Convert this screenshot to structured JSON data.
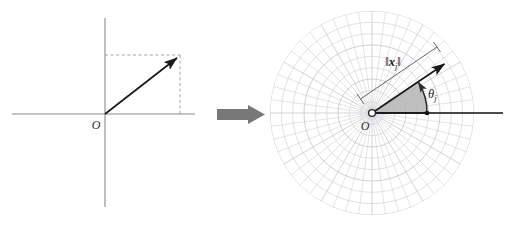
{
  "figure": {
    "background": "#ffffff",
    "width": 511,
    "height": 225,
    "caption": "Cartesian vector transformed to polar representation"
  },
  "left_panel": {
    "name": "cartesian-axes-diagram",
    "origin_label": "O",
    "axis_color": "#8a8a8a",
    "vector_color": "#1a1a1a",
    "dashed_color": "#9a9a9a",
    "origin": {
      "x": 105,
      "y": 114
    },
    "vector_tip": {
      "x": 180,
      "y": 55
    },
    "x_axis": {
      "x1": 12,
      "y1": 114,
      "x2": 195,
      "y2": 114
    },
    "y_axis": {
      "x1": 105,
      "y1": 18,
      "x2": 105,
      "y2": 207
    }
  },
  "transform_arrow": {
    "name": "transform-arrow",
    "color": "#787878",
    "x": 217,
    "y": 105,
    "width": 48,
    "height": 19
  },
  "right_panel": {
    "name": "polar-grid-diagram",
    "origin_label": "O",
    "norm_label": "‖xⱼ‖",
    "norm_label_plain": "||x_j||",
    "angle_label": "θⱼ",
    "angle_label_plain": "theta_j",
    "grid_color": "#c9c9cf",
    "sector_fill": "#b5b5b5",
    "sector_stroke": "#2a2a2a",
    "vector_color": "#1a1a1a",
    "ray_color": "#111111",
    "center": {
      "x": 372,
      "y": 113
    },
    "grid_radius": 102,
    "ring_count": 9,
    "spoke_count": 48,
    "vector_tip": {
      "x": 447,
      "y": 62
    },
    "ray_end": {
      "x": 503,
      "y": 113
    },
    "angle_degrees": 34,
    "sector_radius": 55
  },
  "chart_data": {
    "type": "scatter",
    "title": "",
    "xlabel": "",
    "ylabel": "",
    "series": [
      {
        "name": "vector-cartesian",
        "x": [
          0,
          75
        ],
        "y": [
          0,
          59
        ]
      },
      {
        "name": "vector-polar",
        "r": [
          0,
          91
        ],
        "theta_deg": [
          0,
          34
        ]
      }
    ],
    "annotations": [
      "O",
      "||x_j||",
      "theta_j"
    ],
    "grid": true,
    "legend": "none"
  }
}
